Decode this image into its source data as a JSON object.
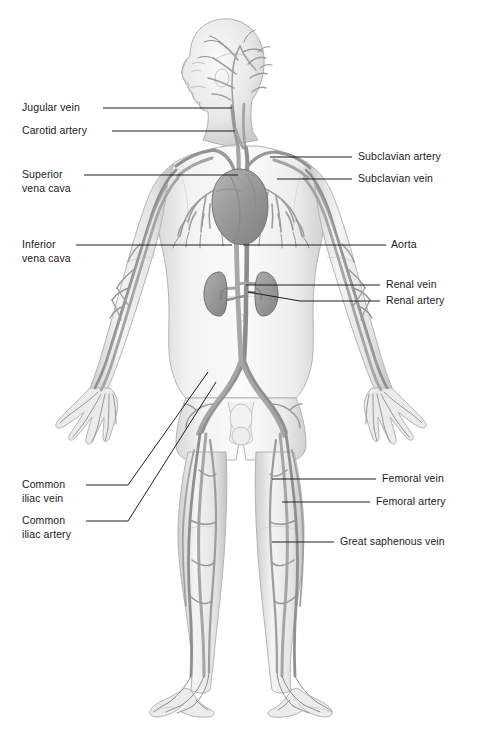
{
  "figure": {
    "background_color": "#ffffff",
    "body_fill": "#e9e9e9",
    "body_stroke": "#b4b4b4",
    "vessel_color": "#9a9a9a",
    "vessel_dark": "#7d7d7d",
    "organ_color": "#9c9c9c",
    "leader_color": "#1f1f1f",
    "label_color": "#1a1a1a"
  },
  "labels": {
    "left": [
      {
        "id": "jugular-vein",
        "text": "Jugular vein",
        "text2": "",
        "x": 22,
        "y": 101,
        "leader": [
          [
            103,
            108
          ],
          [
            232,
            108
          ]
        ]
      },
      {
        "id": "carotid-artery",
        "text": "Carotid artery",
        "text2": "",
        "x": 22,
        "y": 124,
        "leader": [
          [
            112,
            131
          ],
          [
            235,
            131
          ]
        ]
      },
      {
        "id": "superior-vena-cava",
        "text": "Superior",
        "text2": "vena cava",
        "x": 22,
        "y": 168,
        "leader": [
          [
            84,
            175
          ],
          [
            238,
            175
          ]
        ]
      },
      {
        "id": "inferior-vena-cava",
        "text": "Inferior",
        "text2": "vena cava",
        "x": 22,
        "y": 238,
        "leader": [
          [
            76,
            245
          ],
          [
            232,
            245
          ]
        ]
      },
      {
        "id": "common-iliac-vein",
        "text": "Common",
        "text2": "iliac vein",
        "x": 22,
        "y": 478,
        "leader": [
          [
            86,
            485
          ],
          [
            128,
            485
          ],
          [
            208,
            372
          ]
        ]
      },
      {
        "id": "common-iliac-artery",
        "text": "Common",
        "text2": "iliac artery",
        "x": 22,
        "y": 514,
        "leader": [
          [
            86,
            521
          ],
          [
            128,
            521
          ],
          [
            216,
            382
          ]
        ]
      }
    ],
    "right": [
      {
        "id": "subclavian-artery",
        "text": "Subclavian artery",
        "x": 358,
        "y": 150,
        "leader": [
          [
            270,
            157
          ],
          [
            352,
            157
          ]
        ]
      },
      {
        "id": "subclavian-vein",
        "text": "Subclavian vein",
        "x": 358,
        "y": 172,
        "leader": [
          [
            277,
            179
          ],
          [
            352,
            179
          ]
        ]
      },
      {
        "id": "aorta",
        "text": "Aorta",
        "x": 391,
        "y": 238,
        "leader": [
          [
            243,
            245
          ],
          [
            386,
            245
          ]
        ]
      },
      {
        "id": "renal-vein",
        "text": "Renal vein",
        "x": 386,
        "y": 278,
        "leader": [
          [
            246,
            285
          ],
          [
            300,
            285
          ],
          [
            380,
            285
          ]
        ]
      },
      {
        "id": "renal-artery",
        "text": "Renal artery",
        "x": 386,
        "y": 294,
        "leader": [
          [
            248,
            292
          ],
          [
            300,
            301
          ],
          [
            380,
            301
          ]
        ]
      },
      {
        "id": "femoral-vein",
        "text": "Femoral vein",
        "x": 382,
        "y": 472,
        "leader": [
          [
            272,
            479
          ],
          [
            376,
            479
          ]
        ]
      },
      {
        "id": "femoral-artery",
        "text": "Femoral artery",
        "x": 376,
        "y": 495,
        "leader": [
          [
            282,
            502
          ],
          [
            370,
            502
          ]
        ]
      },
      {
        "id": "great-saphenous-vein",
        "text": "Great saphenous vein",
        "x": 340,
        "y": 535,
        "leader": [
          [
            272,
            542
          ],
          [
            334,
            542
          ]
        ]
      }
    ]
  }
}
